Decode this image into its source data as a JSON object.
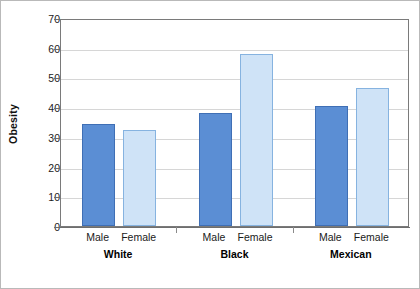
{
  "chart_data": {
    "type": "bar",
    "title": "",
    "xlabel": "",
    "ylabel": "Obesity",
    "ylim": [
      0,
      70
    ],
    "ytick_step": 10,
    "yticks": [
      0,
      10,
      20,
      30,
      40,
      50,
      60,
      70
    ],
    "ytick_labels": [
      "0",
      "10",
      "20",
      "30",
      "40",
      "50",
      "60",
      "70"
    ],
    "grid": true,
    "legend": "none",
    "categories": [
      "White",
      "Black",
      "Mexican"
    ],
    "subcategories": [
      "Male",
      "Female"
    ],
    "series": [
      {
        "name": "Male",
        "values": [
          34.5,
          38.2,
          40.3
        ]
      },
      {
        "name": "Female",
        "values": [
          32.3,
          57.8,
          46.5
        ]
      }
    ],
    "bars": [
      {
        "group": "White",
        "sub": "Male",
        "value": 34.5
      },
      {
        "group": "White",
        "sub": "Female",
        "value": 32.3
      },
      {
        "group": "Black",
        "sub": "Male",
        "value": 38.2
      },
      {
        "group": "Black",
        "sub": "Female",
        "value": 57.8
      },
      {
        "group": "Mexican",
        "sub": "Male",
        "value": 40.3
      },
      {
        "group": "Mexican",
        "sub": "Female",
        "value": 46.5
      }
    ],
    "colors": {
      "male_fill": "#5b8ed4",
      "male_border": "#3f6fb5",
      "female_fill": "#cfe3f7",
      "female_border": "#86b3e0",
      "gridline": "#d6d6d6",
      "axis": "#6e6e6e",
      "plot_background": "#ffffff",
      "frame_border": "#b9b9b9"
    }
  }
}
